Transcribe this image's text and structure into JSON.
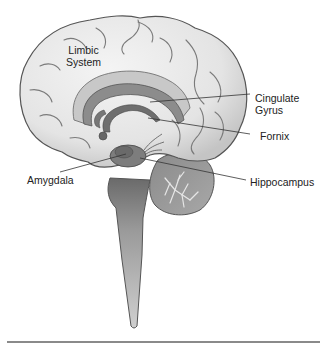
{
  "diagram": {
    "title_label": {
      "line1": "Limbic",
      "line2": "System"
    },
    "labels": [
      {
        "id": "cingulate-gyrus",
        "line1": "Cingulate",
        "line2": "Gyrus"
      },
      {
        "id": "fornix",
        "line1": "Fornix"
      },
      {
        "id": "amygdala",
        "line1": "Amygdala"
      },
      {
        "id": "hippocampus",
        "line1": "Hippocampus"
      }
    ],
    "colors": {
      "cortex_fill": "#e8e8e8",
      "cortex_stroke": "#555555",
      "sulci": "#7a7a7a",
      "cingulate": "#8c8c8c",
      "cingulate_light": "#d0d0d0",
      "fornix": "#6e6e6e",
      "brainstem": "#9a9a9a",
      "spinal": "#c8c8c8",
      "cerebellum": "#999999",
      "leader_line": "#333333",
      "rule": "#8a8a8a"
    }
  }
}
